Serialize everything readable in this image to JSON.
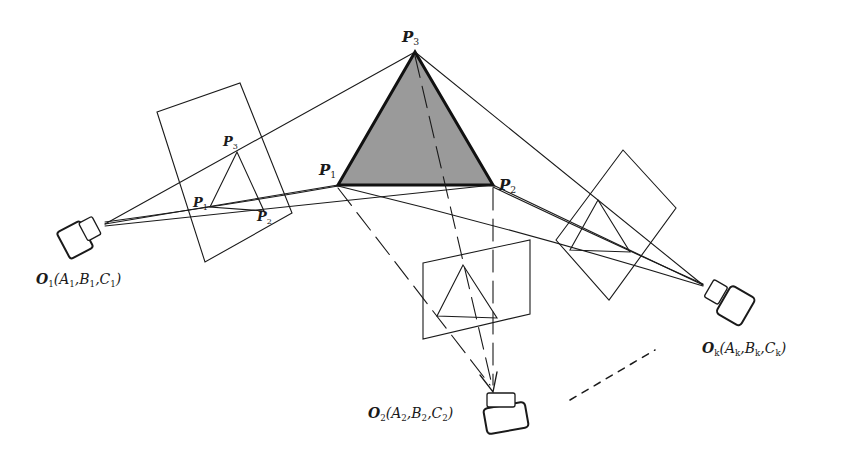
{
  "diagram": {
    "type": "multi-view camera projection geometry",
    "colors": {
      "line": "#1a1a1a",
      "triangle_fill": "#9a9a9a",
      "background": "#ffffff"
    },
    "world_triangle": {
      "fill": "gray",
      "vertices": [
        {
          "id": "P1",
          "label_main": "P",
          "label_sub": "1"
        },
        {
          "id": "P2",
          "label_main": "P",
          "label_sub": "2"
        },
        {
          "id": "P3",
          "label_main": "P",
          "label_sub": "3"
        }
      ]
    },
    "image_plane_left": {
      "projected_points": [
        {
          "label_main": "P",
          "label_sub": "1"
        },
        {
          "label_main": "P",
          "label_sub": "2"
        },
        {
          "label_main": "P",
          "label_sub": "3"
        }
      ]
    },
    "cameras": [
      {
        "id": "O1",
        "label_main": "O",
        "label_sub": "1",
        "args": [
          {
            "m": "A",
            "s": "1"
          },
          {
            "m": "B",
            "s": "1"
          },
          {
            "m": "C",
            "s": "1"
          }
        ]
      },
      {
        "id": "O2",
        "label_main": "O",
        "label_sub": "2",
        "args": [
          {
            "m": "A",
            "s": "2"
          },
          {
            "m": "B",
            "s": "2"
          },
          {
            "m": "C",
            "s": "2"
          }
        ]
      },
      {
        "id": "Ok",
        "label_main": "O",
        "label_sub": "k",
        "args": [
          {
            "m": "A",
            "s": "k"
          },
          {
            "m": "B",
            "s": "k"
          },
          {
            "m": "C",
            "s": "k"
          }
        ]
      }
    ],
    "punct": {
      "open": "(",
      "comma": ",",
      "close": ")"
    }
  }
}
